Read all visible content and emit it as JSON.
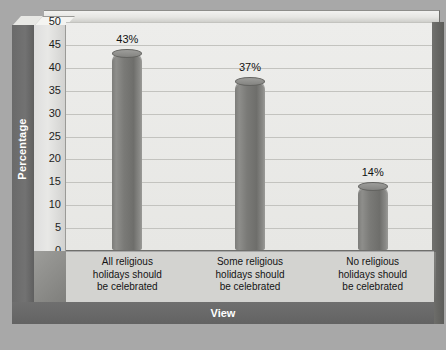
{
  "chart_data": {
    "type": "bar",
    "title": "",
    "xlabel": "View",
    "ylabel": "Percentage",
    "categories": [
      "All religious holidays should be celebrated",
      "Some religious holidays should be celebrated",
      "No religious holidays should be celebrated"
    ],
    "category_lines": [
      [
        "All religious",
        "holidays should",
        "be celebrated"
      ],
      [
        "Some religious",
        "holidays should",
        "be celebrated"
      ],
      [
        "No religious",
        "holidays should",
        "be celebrated"
      ]
    ],
    "values": [
      43,
      37,
      14
    ],
    "data_labels": [
      "43%",
      "37%",
      "14%"
    ],
    "ylim": [
      0,
      50
    ],
    "yticks": [
      50,
      45,
      40,
      35,
      30,
      25,
      20,
      15,
      10,
      5,
      0
    ],
    "ytick_labels": [
      "50",
      "45",
      "40",
      "35",
      "30",
      "25",
      "20",
      "15",
      "10",
      "5",
      "0"
    ],
    "grid": true,
    "legend": "none",
    "style": "3d-cylinder",
    "colors": {
      "bar": "#7a7a77",
      "plot_background": "#ededeb",
      "gridline": "#c3c3bf",
      "axis_wall": "#6f6f6f",
      "page_background": "#a8a8a8",
      "axis_title_text": "#ffffff",
      "tick_text": "#1d1d1d"
    }
  }
}
